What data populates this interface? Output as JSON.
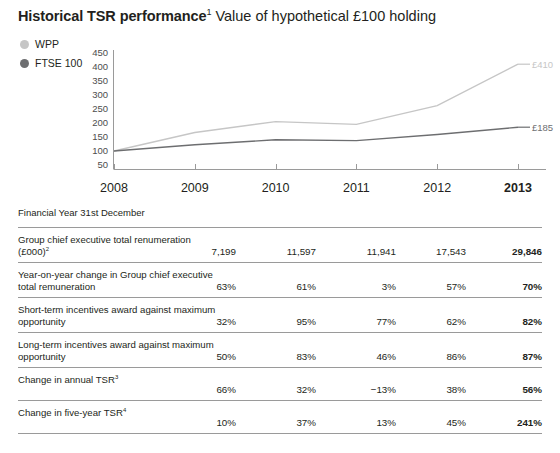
{
  "title": {
    "strong": "Historical TSR performance",
    "strong_sup": "1",
    "light": " Value of hypothetical £100 holding"
  },
  "legend": {
    "items": [
      {
        "label": "WPP",
        "color": "#c6c6c6",
        "icon": "legend-dot-icon"
      },
      {
        "label": "FTSE 100",
        "color": "#6d6e70",
        "icon": "legend-dot-icon"
      }
    ]
  },
  "chart_data": {
    "type": "line",
    "xlabel": "",
    "ylabel": "",
    "x": [
      "2008",
      "2009",
      "2010",
      "2011",
      "2012",
      "2013"
    ],
    "categories": [
      "2008",
      "2009",
      "2010",
      "2011",
      "2012",
      "2013"
    ],
    "yticks": [
      50,
      100,
      150,
      200,
      250,
      300,
      350,
      400,
      450
    ],
    "ylim": [
      0,
      465
    ],
    "grid": false,
    "legend_position": "top-left",
    "series": [
      {
        "name": "WPP",
        "color": "#c6c6c6",
        "values": [
          100,
          166,
          205,
          195,
          262,
          410
        ],
        "end_label": "£410"
      },
      {
        "name": "FTSE 100",
        "color": "#6d6e70",
        "values": [
          100,
          122,
          140,
          137,
          159,
          185
        ],
        "end_label": "£185"
      }
    ]
  },
  "year_header": {
    "years": [
      "2008",
      "2009",
      "2010",
      "2011",
      "2012",
      "2013"
    ],
    "current_year": "2013"
  },
  "table": {
    "subhead": "Financial Year 31st December",
    "rows": [
      {
        "label": "Group chief executive total renumeration (£000)",
        "label_sup": "2",
        "values": [
          "7,199",
          "11,597",
          "11,941",
          "17,543",
          "29,846"
        ]
      },
      {
        "label": "Year-on-year change in Group chief executive total remuneration",
        "label_sup": "",
        "values": [
          "63%",
          "61%",
          "3%",
          "57%",
          "70%"
        ]
      },
      {
        "label": "Short-term incentives award against maximum opportunity",
        "label_sup": "",
        "values": [
          "32%",
          "95%",
          "77%",
          "62%",
          "82%"
        ]
      },
      {
        "label": "Long-term incentives award against maximum opportunity",
        "label_sup": "",
        "values": [
          "50%",
          "83%",
          "46%",
          "86%",
          "87%"
        ]
      },
      {
        "label": "Change in annual TSR",
        "label_sup": "3",
        "values": [
          "66%",
          "32%",
          "−13%",
          "38%",
          "56%"
        ]
      },
      {
        "label": "Change in five-year TSR",
        "label_sup": "4",
        "values": [
          "10%",
          "37%",
          "13%",
          "45%",
          "241%"
        ]
      }
    ]
  }
}
